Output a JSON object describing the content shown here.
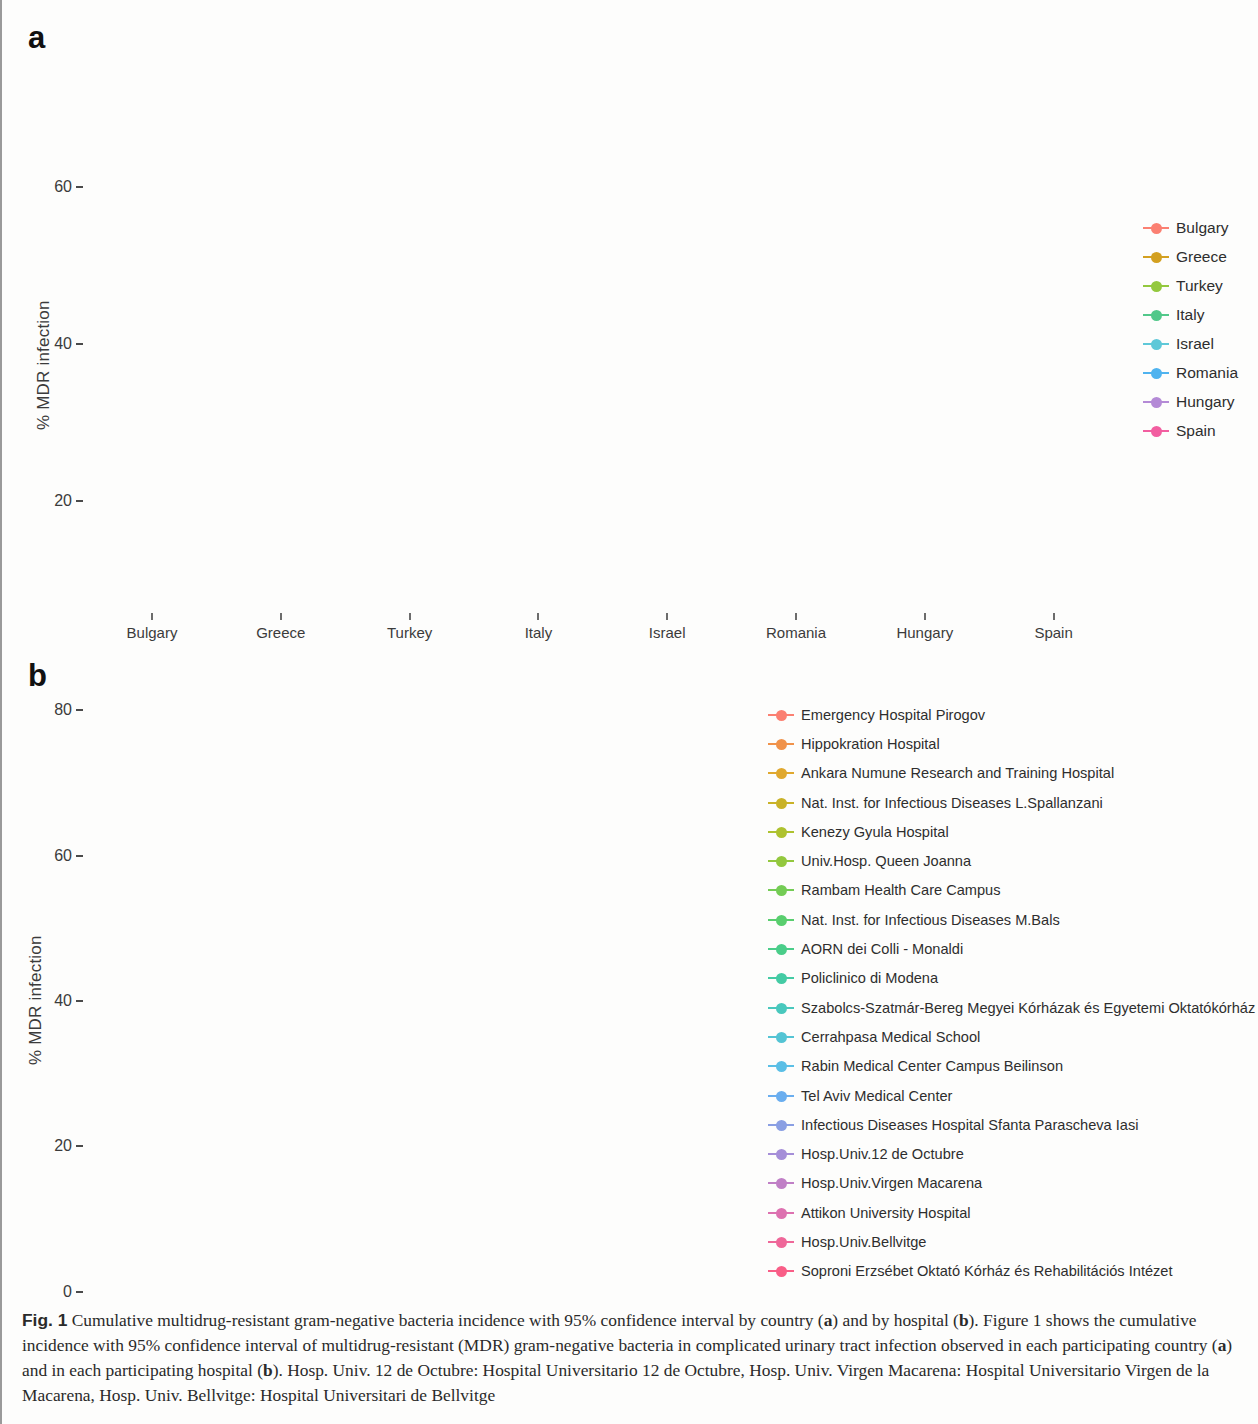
{
  "figure": {
    "panel_a_letter": "a",
    "panel_b_letter": "b",
    "caption_parts": {
      "label": "Fig. 1",
      "t1": " Cumulative multidrug-resistant gram-negative bacteria incidence with 95% confidence interval by country (",
      "a1": "a",
      "t2": ") and by hospital (",
      "b1": "b",
      "t3": "). Figure 1 shows the cumulative incidence with 95% confidence interval of multidrug-resistant (MDR) gram-negative bacteria in complicated urinary tract infection observed in each participating country (",
      "a2": "a",
      "t4": ") and in each participating hospital (",
      "b2": "b",
      "t5": "). Hosp. Univ. 12 de Octubre: Hospital Universitario 12 de Octubre, Hosp. Univ. Virgen Macarena: Hospital Universitario Virgen de la Macarena, Hosp. Univ. Bellvitge: Hospital Universitari de Bellvitge"
    }
  },
  "chart_data": [
    {
      "type": "scatter",
      "panel": "a",
      "title": "",
      "xlabel": "",
      "ylabel": "% MDR infection",
      "ylim": [
        5,
        68
      ],
      "yticks": [
        20,
        40,
        60
      ],
      "ytick_labels": [
        "20",
        "40",
        "60"
      ],
      "grid": false,
      "legend_position": "right",
      "categories": [
        "Bulgary",
        "Greece",
        "Turkey",
        "Italy",
        "Israel",
        "Romania",
        "Hungary",
        "Spain"
      ],
      "values": [
        52.6,
        36.1,
        34.4,
        29.4,
        23.4,
        23.1,
        19.2,
        14.1
      ],
      "ci_lower": [
        42.8,
        25.6,
        24.6,
        20.5,
        17.2,
        16.2,
        11.7,
        8.5
      ],
      "ci_upper": [
        62.3,
        46.5,
        43.7,
        37.8,
        30.1,
        30.4,
        27.3,
        19.4
      ],
      "colors": [
        "#fb8072",
        "#d3a020",
        "#93c83e",
        "#52c88a",
        "#5ec8d8",
        "#4fb3ef",
        "#b48ad6",
        "#f25ea0"
      ],
      "legend": [
        {
          "label": "Bulgary",
          "color": "#fb8072"
        },
        {
          "label": "Greece",
          "color": "#d3a020"
        },
        {
          "label": "Turkey",
          "color": "#93c83e"
        },
        {
          "label": "Italy",
          "color": "#52c88a"
        },
        {
          "label": "Israel",
          "color": "#5ec8d8"
        },
        {
          "label": "Romania",
          "color": "#4fb3ef"
        },
        {
          "label": "Hungary",
          "color": "#b48ad6"
        },
        {
          "label": "Spain",
          "color": "#f25ea0"
        }
      ]
    },
    {
      "type": "scatter",
      "panel": "b",
      "title": "",
      "xlabel": "",
      "ylabel": "% MDR infection",
      "ylim": [
        -3,
        84
      ],
      "yticks": [
        0,
        20,
        40,
        60,
        80
      ],
      "ytick_labels": [
        "0",
        "20",
        "40",
        "60",
        "80"
      ],
      "grid": false,
      "legend_position": "right",
      "categories": [
        "Emergency Hospital Pirogov",
        "Hippokration Hospital",
        "Ankara Numune Research and Training Hospital",
        "Nat. Inst. for Infectious Diseases L.Spallanzani",
        "Kenezy Gyula Hospital",
        "Univ.Hosp. Queen Joanna",
        "Rambam Health Care Campus",
        "Nat. Inst. for Infectious Diseases M.Bals",
        "AORN dei Colli - Monaldi",
        "Policlinico di Modena",
        "Szabolcs-Szatmár-Bereg Megyei Kórházak és Egyetemi Oktatókórház",
        "Cerrahpasa Medical School",
        "Rabin Medical Center Campus Beilinson",
        "Tel Aviv Medical Center",
        "Infectious Diseases Hospital Sfanta Parascheva Iasi",
        "Hosp.Univ.12 de Octubre",
        "Hosp.Univ.Virgen Macarena",
        "Attikon University Hospital",
        "Hosp.Univ.Bellvitge",
        "Soproni Erzsébet Oktató Kórház és Rehabilitációs Intézet"
      ],
      "values": [
        67.2,
        45.8,
        41.8,
        37.6,
        33.8,
        33.2,
        29.3,
        28.2,
        26.8,
        23.0,
        23.0,
        22.2,
        20.8,
        20.1,
        19.2,
        19.1,
        14.3,
        12.7,
        11.0,
        8.5
      ],
      "ci_lower": [
        55.2,
        33.5,
        29.7,
        22.7,
        13.6,
        18.8,
        17.2,
        16.3,
        12.2,
        10.3,
        10.3,
        9.0,
        10.3,
        10.7,
        10.6,
        7.7,
        4.4,
        0.0,
        2.8,
        0.0
      ],
      "ci_upper": [
        79.2,
        58.6,
        54.3,
        52.5,
        53.8,
        46.8,
        40.6,
        39.3,
        41.4,
        35.0,
        35.0,
        34.5,
        31.5,
        30.6,
        28.4,
        31.0,
        23.8,
        25.2,
        18.3,
        16.8
      ],
      "colors": [
        "#fb8072",
        "#f0924a",
        "#e0a82e",
        "#c9b227",
        "#aec22f",
        "#93c83e",
        "#74cc55",
        "#59ce6e",
        "#4acd89",
        "#44cba4",
        "#49c8bd",
        "#54c4d4",
        "#5bbfe6",
        "#6aaeef",
        "#8a9fe3",
        "#a58ed8",
        "#c07fc6",
        "#dd71b0",
        "#ef6799",
        "#f95e87"
      ],
      "legend": [
        {
          "label": "Emergency Hospital Pirogov",
          "color": "#fb8072"
        },
        {
          "label": "Hippokration Hospital",
          "color": "#f0924a"
        },
        {
          "label": "Ankara Numune Research and Training Hospital",
          "color": "#e0a82e"
        },
        {
          "label": "Nat. Inst. for Infectious Diseases L.Spallanzani",
          "color": "#c9b227"
        },
        {
          "label": "Kenezy Gyula Hospital",
          "color": "#aec22f"
        },
        {
          "label": "Univ.Hosp. Queen Joanna",
          "color": "#93c83e"
        },
        {
          "label": "Rambam Health Care Campus",
          "color": "#74cc55"
        },
        {
          "label": "Nat. Inst. for Infectious Diseases M.Bals",
          "color": "#59ce6e"
        },
        {
          "label": "AORN dei Colli - Monaldi",
          "color": "#4acd89"
        },
        {
          "label": "Policlinico di Modena",
          "color": "#44cba4"
        },
        {
          "label": "Szabolcs-Szatmár-Bereg Megyei Kórházak és Egyetemi Oktatókórház",
          "color": "#49c8bd"
        },
        {
          "label": "Cerrahpasa Medical School",
          "color": "#54c4d4"
        },
        {
          "label": "Rabin Medical Center Campus Beilinson",
          "color": "#5bbfe6"
        },
        {
          "label": "Tel Aviv Medical Center",
          "color": "#6aaeef"
        },
        {
          "label": "Infectious Diseases Hospital Sfanta Parascheva Iasi",
          "color": "#8a9fe3"
        },
        {
          "label": "Hosp.Univ.12 de Octubre",
          "color": "#a58ed8"
        },
        {
          "label": "Hosp.Univ.Virgen Macarena",
          "color": "#c07fc6"
        },
        {
          "label": "Attikon University Hospital",
          "color": "#dd71b0"
        },
        {
          "label": "Hosp.Univ.Bellvitge",
          "color": "#ef6799"
        },
        {
          "label": "Soproni Erzsébet Oktató Kórház és Rehabilitációs Intézet",
          "color": "#f95e87"
        }
      ]
    }
  ]
}
